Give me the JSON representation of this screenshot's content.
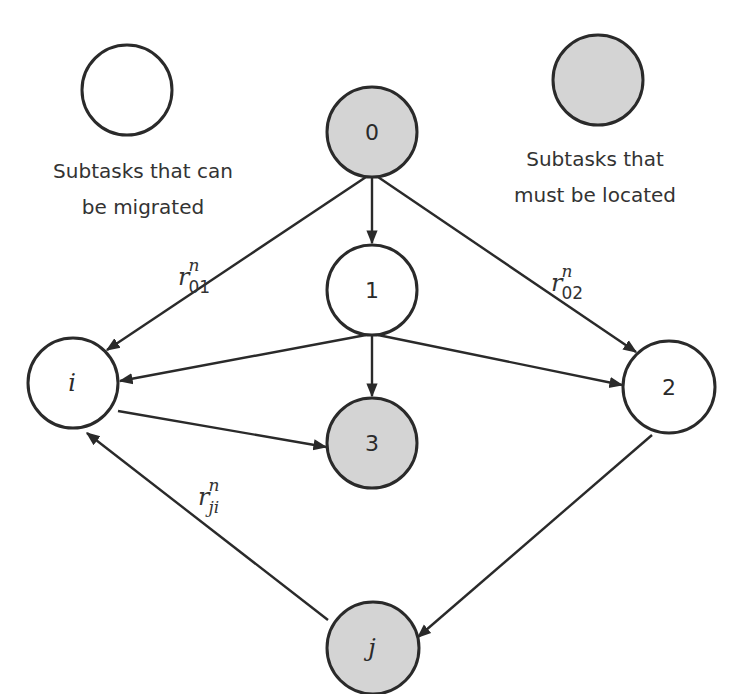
{
  "colors": {
    "migratable_fill": "#ffffff",
    "located_fill": "#d4d4d4",
    "stroke": "#2a2a2a",
    "text": "#333333"
  },
  "legend": {
    "migratable": {
      "line1": "Subtasks that can",
      "line2": "be migrated"
    },
    "located": {
      "line1": "Subtasks that",
      "line2": "must be located"
    }
  },
  "nodes": {
    "n0": {
      "label": "0",
      "type": "located"
    },
    "n1": {
      "label": "1",
      "type": "migratable"
    },
    "n2": {
      "label": "2",
      "type": "migratable"
    },
    "n3": {
      "label": "3",
      "type": "located"
    },
    "ni": {
      "label": "i",
      "type": "migratable"
    },
    "nj": {
      "label": "j",
      "type": "located"
    }
  },
  "edges": [
    {
      "from": "0",
      "to": "1"
    },
    {
      "from": "0",
      "to": "i",
      "label": "r_01^n"
    },
    {
      "from": "0",
      "to": "2",
      "label": "r_02^n"
    },
    {
      "from": "1",
      "to": "i"
    },
    {
      "from": "1",
      "to": "3"
    },
    {
      "from": "1",
      "to": "2"
    },
    {
      "from": "i",
      "to": "3"
    },
    {
      "from": "2",
      "to": "j"
    },
    {
      "from": "j",
      "to": "i",
      "label": "r_ji^n"
    }
  ],
  "edge_labels": {
    "r01": {
      "base": "r",
      "sup": "n",
      "sub": "01"
    },
    "r02": {
      "base": "r",
      "sup": "n",
      "sub": "02"
    },
    "rji": {
      "base": "r",
      "sup": "n",
      "sub": "ji"
    }
  }
}
